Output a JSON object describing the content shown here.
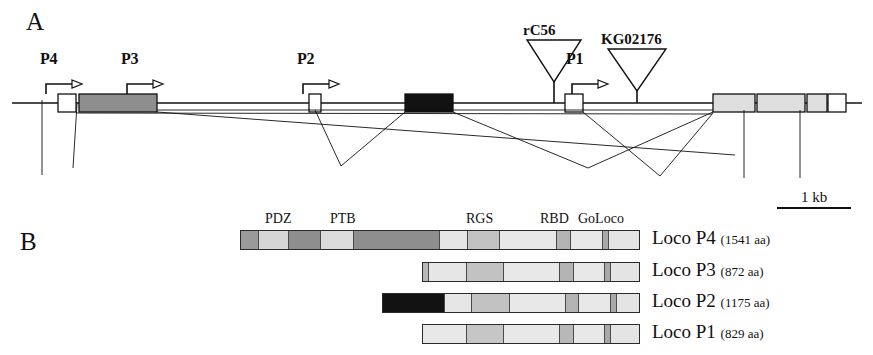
{
  "figure": {
    "panel_a_letter": "A",
    "panel_b_letter": "B",
    "scale": {
      "label": "1 kb"
    }
  },
  "panel_a": {
    "promoters": [
      {
        "name": "P4",
        "label": "P4",
        "x": 40,
        "y": 66
      },
      {
        "name": "P3",
        "label": "P3",
        "x": 121,
        "y": 66
      },
      {
        "name": "P2",
        "label": "P2",
        "x": 297,
        "y": 66
      },
      {
        "name": "P1",
        "label": "P1",
        "x": 566,
        "y": 66
      }
    ],
    "insertions": [
      {
        "name": "rC56",
        "label": "rC56",
        "label_x": 523,
        "label_y": 22,
        "apex_x": 554,
        "top_y": 40,
        "half_width": 27,
        "stem_bottom": 103
      },
      {
        "name": "KG02176",
        "label": "KG02176",
        "label_x": 601,
        "label_y": 31,
        "apex_x": 637,
        "top_y": 49,
        "half_width": 29,
        "stem_bottom": 103
      }
    ],
    "exons": [
      {
        "name": "exon-p4",
        "x": 58,
        "w": 18,
        "fill": "#ffffff"
      },
      {
        "name": "exon-p3",
        "x": 79,
        "w": 78,
        "fill": "#8e8e8e"
      },
      {
        "name": "exon-p2",
        "x": 309,
        "w": 12,
        "fill": "#ffffff"
      },
      {
        "name": "exon-black",
        "x": 405,
        "w": 48,
        "fill": "#121212"
      },
      {
        "name": "exon-p1",
        "x": 565,
        "w": 18,
        "fill": "#ffffff"
      },
      {
        "name": "exon-3a",
        "x": 713,
        "w": 42,
        "fill": "#dedede"
      },
      {
        "name": "exon-3b",
        "x": 757,
        "w": 48,
        "fill": "#dedede"
      },
      {
        "name": "exon-3c",
        "x": 807,
        "w": 20,
        "fill": "#dedede"
      },
      {
        "name": "exon-3d",
        "x": 828,
        "w": 18,
        "fill": "#ffffff"
      }
    ]
  },
  "panel_b": {
    "domain_labels": [
      {
        "name": "PDZ",
        "label": "PDZ",
        "x": 265,
        "y": 211
      },
      {
        "name": "PTB",
        "label": "PTB",
        "x": 330,
        "y": 211
      },
      {
        "name": "RGS",
        "label": "RGS",
        "x": 466,
        "y": 211
      },
      {
        "name": "RBD",
        "label": "RBD",
        "x": 540,
        "y": 211
      },
      {
        "name": "GoLoco",
        "label": "GoLoco",
        "x": 578,
        "y": 211
      }
    ],
    "proteins": [
      {
        "name": "Loco P4",
        "aa": "(1541 aa)",
        "x": 240,
        "y": 230,
        "w": 400,
        "segments": [
          {
            "w": 18,
            "fill": "#9a9a9a"
          },
          {
            "w": 30,
            "fill": "#d6d6d6"
          },
          {
            "w": 32,
            "fill": "#8e8e8e"
          },
          {
            "w": 34,
            "fill": "#dcdcdc"
          },
          {
            "w": 86,
            "fill": "#8e8e8e"
          },
          {
            "w": 28,
            "fill": "#e6e6e6"
          },
          {
            "w": 32,
            "fill": "#c2c2c2"
          },
          {
            "w": 58,
            "fill": "#e8e8e8"
          },
          {
            "w": 14,
            "fill": "#b4b4b4"
          },
          {
            "w": 32,
            "fill": "#e8e8e8"
          },
          {
            "w": 6,
            "fill": "#a8a8a8"
          },
          {
            "w": 30,
            "fill": "#e4e4e4"
          }
        ]
      },
      {
        "name": "Loco P3",
        "aa": "(872 aa)",
        "x": 422,
        "y": 262,
        "w": 218,
        "segments": [
          {
            "w": 6,
            "fill": "#b8b8b8"
          },
          {
            "w": 38,
            "fill": "#e6e6e6"
          },
          {
            "w": 38,
            "fill": "#c2c2c2"
          },
          {
            "w": 56,
            "fill": "#e8e8e8"
          },
          {
            "w": 14,
            "fill": "#b4b4b4"
          },
          {
            "w": 32,
            "fill": "#e8e8e8"
          },
          {
            "w": 6,
            "fill": "#a8a8a8"
          },
          {
            "w": 28,
            "fill": "#e4e4e4"
          }
        ]
      },
      {
        "name": "Loco P2",
        "aa": "(1175 aa)",
        "x": 382,
        "y": 293,
        "w": 258,
        "segments": [
          {
            "w": 62,
            "fill": "#121212"
          },
          {
            "w": 28,
            "fill": "#e6e6e6"
          },
          {
            "w": 38,
            "fill": "#c2c2c2"
          },
          {
            "w": 56,
            "fill": "#e8e8e8"
          },
          {
            "w": 14,
            "fill": "#b4b4b4"
          },
          {
            "w": 32,
            "fill": "#e8e8e8"
          },
          {
            "w": 6,
            "fill": "#a8a8a8"
          },
          {
            "w": 22,
            "fill": "#e4e4e4"
          }
        ]
      },
      {
        "name": "Loco P1",
        "aa": "(829 aa)",
        "x": 422,
        "y": 324,
        "w": 218,
        "segments": [
          {
            "w": 44,
            "fill": "#e8e8e8"
          },
          {
            "w": 38,
            "fill": "#c6c6c6"
          },
          {
            "w": 56,
            "fill": "#e8e8e8"
          },
          {
            "w": 14,
            "fill": "#b8b8b8"
          },
          {
            "w": 32,
            "fill": "#e8e8e8"
          },
          {
            "w": 6,
            "fill": "#a8a8a8"
          },
          {
            "w": 28,
            "fill": "#e4e4e4"
          }
        ]
      }
    ]
  }
}
